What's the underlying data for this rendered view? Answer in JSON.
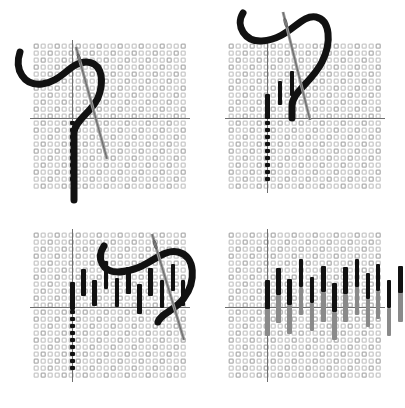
{
  "figure": {
    "panel_count": 4,
    "background_color": "#ffffff",
    "colors": {
      "canvas_thread": "#c9c9c9",
      "canvas_thread_dark": "#b0b0b0",
      "guide_line": "#6e6e6e",
      "stitch_dark": "#111111",
      "stitch_light": "#8a8a8a",
      "needle": "#9a9a9a",
      "needle_outline": "#555555",
      "working_thread": "#111111"
    },
    "canvas": {
      "cell_size": 7,
      "cols": 22,
      "rows": 21,
      "hole_size": 4
    }
  },
  "panels": [
    {
      "id": "panel-1",
      "step_number": "1",
      "caption": "Bring needle up and form the first vertical stitch",
      "origin": {
        "x": 33,
        "y": 43
      },
      "grid": {
        "cols": 22,
        "rows": 21
      },
      "guides": {
        "vertical_col": 5.6,
        "horizontal_row": 10.7
      },
      "stitches_dark": [],
      "stitches_light": [],
      "dotted_column": {
        "col": 5.6,
        "row_start": 10.9,
        "row_count": 9
      },
      "needle": {
        "x1": 76,
        "y1": 47,
        "x2": 107,
        "y2": 159,
        "width": 3
      },
      "thread_path": "M 20 52 C 14 70 24 86 42 84 C 62 82 70 62 86 62 C 100 62 104 76 100 92 C 96 110 76 118 74 132 L 74 200",
      "thread_width": 7
    },
    {
      "id": "panel-2",
      "step_number": "2",
      "caption": "Work alternating long and short stitches along the row",
      "origin": {
        "x": 228,
        "y": 43
      },
      "grid": {
        "cols": 22,
        "rows": 21
      },
      "guides": {
        "vertical_col": 5.6,
        "horizontal_row": 10.7
      },
      "stitches_dark": [
        {
          "col": 5.6,
          "row_top": 7.3,
          "length_rows": 3.6,
          "kind": "long"
        },
        {
          "col": 7.4,
          "row_top": 5.4,
          "length_rows": 3.5,
          "kind": "short"
        },
        {
          "col": 9.1,
          "row_top": 4.0,
          "length_rows": 3.6,
          "kind": "long"
        }
      ],
      "stitches_light": [],
      "dotted_column": {
        "col": 5.6,
        "row_start": 10.9,
        "row_count": 9
      },
      "needle": {
        "x1": 283,
        "y1": 12,
        "x2": 310,
        "y2": 120,
        "width": 3
      },
      "thread_path": "M 243 13 C 235 26 245 42 262 41 C 290 39 300 14 316 17 C 330 20 332 42 322 62 C 312 82 292 92 292 106 L 292 118",
      "thread_width": 7
    },
    {
      "id": "panel-3",
      "step_number": "3",
      "caption": "Complete the first row of long-and-short stitches",
      "origin": {
        "x": 33,
        "y": 232
      },
      "grid": {
        "cols": 22,
        "rows": 21
      },
      "guides": {
        "vertical_col": 5.6,
        "horizontal_row": 10.7
      },
      "stitches_dark": [
        {
          "col": 5.6,
          "row_top": 7.2,
          "length_rows": 4.0,
          "kind": "long"
        },
        {
          "col": 7.2,
          "row_top": 5.3,
          "length_rows": 3.8,
          "kind": "short"
        },
        {
          "col": 8.8,
          "row_top": 6.8,
          "length_rows": 3.8,
          "kind": "long"
        },
        {
          "col": 10.4,
          "row_top": 4.2,
          "length_rows": 3.9,
          "kind": "short"
        },
        {
          "col": 12.0,
          "row_top": 6.6,
          "length_rows": 4.1,
          "kind": "long"
        },
        {
          "col": 13.6,
          "row_top": 5.0,
          "length_rows": 3.8,
          "kind": "short"
        },
        {
          "col": 15.2,
          "row_top": 7.4,
          "length_rows": 4.3,
          "kind": "long"
        },
        {
          "col": 16.8,
          "row_top": 5.2,
          "length_rows": 3.9,
          "kind": "short"
        },
        {
          "col": 18.4,
          "row_top": 6.9,
          "length_rows": 3.9,
          "kind": "long"
        },
        {
          "col": 20.0,
          "row_top": 4.6,
          "length_rows": 3.9,
          "kind": "short"
        },
        {
          "col": 21.4,
          "row_top": 6.8,
          "length_rows": 3.8,
          "kind": "long"
        }
      ],
      "stitches_light": [],
      "dotted_column": {
        "col": 5.6,
        "row_start": 10.9,
        "row_count": 9
      },
      "needle": {
        "x1": 152,
        "y1": 234,
        "x2": 184,
        "y2": 340,
        "width": 3
      },
      "thread_path": "M 104 246 C 96 258 102 272 118 272 C 146 272 160 248 178 252 C 196 256 196 282 184 298 C 176 310 160 314 158 322",
      "thread_width": 7
    },
    {
      "id": "panel-4",
      "step_number": "4",
      "caption": "Second row worked in a lighter shade to interlock with the first",
      "origin": {
        "x": 228,
        "y": 232
      },
      "grid": {
        "cols": 22,
        "rows": 21
      },
      "guides": {
        "vertical_col": 5.6,
        "horizontal_row": 10.7
      },
      "stitches_dark": [
        {
          "col": 5.6,
          "row_top": 6.9,
          "length_rows": 4.1,
          "kind": "long"
        },
        {
          "col": 7.2,
          "row_top": 5.2,
          "length_rows": 3.8,
          "kind": "short"
        },
        {
          "col": 8.8,
          "row_top": 6.7,
          "length_rows": 3.7,
          "kind": "long"
        },
        {
          "col": 10.4,
          "row_top": 3.9,
          "length_rows": 4.0,
          "kind": "short"
        },
        {
          "col": 12.0,
          "row_top": 6.4,
          "length_rows": 3.8,
          "kind": "long"
        },
        {
          "col": 13.6,
          "row_top": 4.9,
          "length_rows": 3.7,
          "kind": "short"
        },
        {
          "col": 15.2,
          "row_top": 7.3,
          "length_rows": 4.2,
          "kind": "long"
        },
        {
          "col": 16.8,
          "row_top": 5.0,
          "length_rows": 3.8,
          "kind": "short"
        },
        {
          "col": 18.4,
          "row_top": 3.8,
          "length_rows": 4.0,
          "kind": "long"
        },
        {
          "col": 20.0,
          "row_top": 5.8,
          "length_rows": 3.8,
          "kind": "short"
        },
        {
          "col": 21.4,
          "row_top": 4.6,
          "length_rows": 3.9,
          "kind": "long"
        },
        {
          "col": 23.0,
          "row_top": 6.9,
          "length_rows": 4.0,
          "kind": "short"
        },
        {
          "col": 24.6,
          "row_top": 4.8,
          "length_rows": 3.9,
          "kind": "long"
        },
        {
          "col": 26.2,
          "row_top": 3.5,
          "length_rows": 4.0,
          "kind": "short"
        }
      ],
      "stitches_light": [
        {
          "col": 5.6,
          "row_top": 10.6,
          "length_rows": 4.2
        },
        {
          "col": 7.2,
          "row_top": 9.0,
          "length_rows": 4.0
        },
        {
          "col": 8.8,
          "row_top": 10.4,
          "length_rows": 4.2
        },
        {
          "col": 10.4,
          "row_top": 7.8,
          "length_rows": 4.1
        },
        {
          "col": 12.0,
          "row_top": 10.2,
          "length_rows": 4.0
        },
        {
          "col": 13.6,
          "row_top": 8.6,
          "length_rows": 4.2
        },
        {
          "col": 15.2,
          "row_top": 11.4,
          "length_rows": 4.0
        },
        {
          "col": 16.8,
          "row_top": 8.8,
          "length_rows": 4.1
        },
        {
          "col": 18.4,
          "row_top": 7.7,
          "length_rows": 4.2
        },
        {
          "col": 20.0,
          "row_top": 9.6,
          "length_rows": 4.0
        },
        {
          "col": 21.4,
          "row_top": 8.4,
          "length_rows": 4.1
        },
        {
          "col": 23.0,
          "row_top": 10.8,
          "length_rows": 4.0
        },
        {
          "col": 24.6,
          "row_top": 8.6,
          "length_rows": 4.2
        },
        {
          "col": 26.2,
          "row_top": 7.3,
          "length_rows": 4.1
        }
      ],
      "dotted_column": null,
      "needle": null,
      "thread_path": null,
      "thread_width": 0
    }
  ]
}
